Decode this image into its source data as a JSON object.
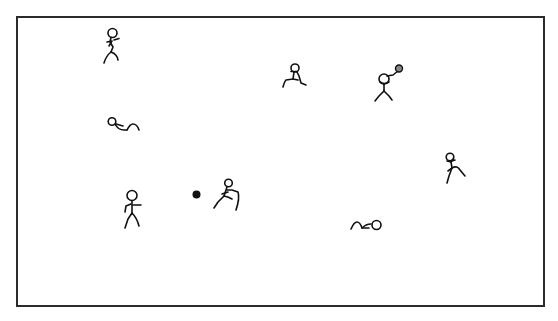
{
  "scene": {
    "description": "Stick figures playing in a rectangular field",
    "frame": {
      "border_color": "#2b2b2b",
      "background": "#ffffff"
    },
    "ink_color": "#111111",
    "ball_color": "#111111",
    "held_ball_color": "#888888",
    "figures": [
      {
        "id": "figure-1",
        "pose": "running",
        "x": 103,
        "y": 27
      },
      {
        "id": "figure-2",
        "pose": "lying-down",
        "x": 107,
        "y": 118
      },
      {
        "id": "figure-3",
        "pose": "running",
        "x": 283,
        "y": 63
      },
      {
        "id": "figure-4",
        "pose": "throwing-ball",
        "x": 373,
        "y": 63
      },
      {
        "id": "figure-5",
        "pose": "running",
        "x": 445,
        "y": 152
      },
      {
        "id": "figure-6",
        "pose": "standing",
        "x": 122,
        "y": 187
      },
      {
        "id": "figure-7",
        "pose": "kicking",
        "x": 214,
        "y": 178
      },
      {
        "id": "figure-8",
        "pose": "lying-down",
        "x": 350,
        "y": 216
      }
    ],
    "ball": {
      "x": 196,
      "y": 194,
      "radius": 4
    }
  }
}
